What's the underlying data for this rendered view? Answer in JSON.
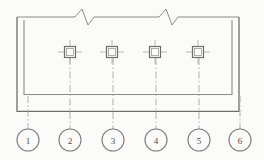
{
  "drawing": {
    "title": "Connector terminal block sectional view",
    "background_color": "#fbfbf9",
    "line_color": "#8c8c8c",
    "line_color_dark": "#6e6e6e",
    "centerline_color": "#a8a8a8",
    "text_color": "#4a4a4a",
    "outer_frame": {
      "name": "outer-housing-outline",
      "x": 17,
      "y": 17,
      "width": 222,
      "height": 95
    },
    "inner_frame": {
      "name": "inner-housing-outline",
      "x": 24,
      "y": 20,
      "width": 208,
      "height": 75
    },
    "break_symbols": [
      {
        "label": "break-left",
        "center_x": 88,
        "y": 17,
        "span": 26,
        "amplitude": 7
      },
      {
        "label": "break-right",
        "center_x": 172,
        "y": 17,
        "span": 26,
        "amplitude": 7
      }
    ],
    "terminals": [
      {
        "label": "terminal-1",
        "cx": 70,
        "cy": 52,
        "size": 11,
        "tick": 8
      },
      {
        "label": "terminal-2",
        "cx": 112,
        "cy": 52,
        "size": 11,
        "tick": 8
      },
      {
        "label": "terminal-3",
        "cx": 155,
        "cy": 52,
        "size": 11,
        "tick": 8
      },
      {
        "label": "terminal-4",
        "cx": 198,
        "cy": 52,
        "size": 11,
        "tick": 8
      }
    ],
    "callouts": [
      {
        "number": "1",
        "cx": 28,
        "cy": 140,
        "r": 11,
        "leader_from_y": 96,
        "leader_to_y": 129
      },
      {
        "number": "2",
        "cx": 70,
        "cy": 140,
        "r": 11,
        "leader_from_y": 58,
        "leader_to_y": 129
      },
      {
        "number": "3",
        "cx": 113,
        "cy": 140,
        "r": 11,
        "leader_from_y": 58,
        "leader_to_y": 129
      },
      {
        "number": "4",
        "cx": 156,
        "cy": 140,
        "r": 11,
        "leader_from_y": 58,
        "leader_to_y": 129
      },
      {
        "number": "5",
        "cx": 199,
        "cy": 140,
        "r": 11,
        "leader_from_y": 58,
        "leader_to_y": 129
      },
      {
        "number": "6",
        "cx": 240,
        "cy": 140,
        "r": 11,
        "leader_from_y": 96,
        "leader_to_y": 129
      }
    ]
  }
}
